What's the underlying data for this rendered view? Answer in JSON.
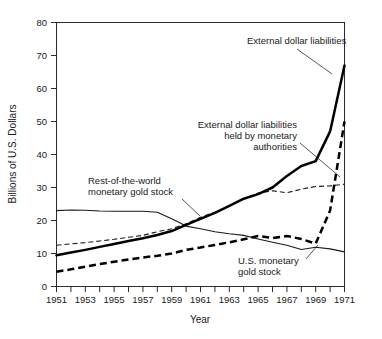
{
  "chart_data": {
    "type": "line",
    "title": "",
    "xlabel": "Year",
    "ylabel": "Billions of U.S. Dollars",
    "xlim": [
      1951,
      1971
    ],
    "ylim": [
      0,
      80
    ],
    "grid": false,
    "legend_position": "none (inline annotations with leader lines)",
    "x": [
      1951,
      1952,
      1953,
      1954,
      1955,
      1956,
      1957,
      1958,
      1959,
      1960,
      1961,
      1962,
      1963,
      1964,
      1965,
      1966,
      1967,
      1968,
      1969,
      1970,
      1971
    ],
    "xtick_labels": [
      "1951",
      "1953",
      "1955",
      "1957",
      "1959",
      "1961",
      "1963",
      "1965",
      "1967",
      "1969",
      "1971"
    ],
    "xtick_values": [
      1951,
      1953,
      1955,
      1957,
      1959,
      1961,
      1963,
      1965,
      1967,
      1969,
      1971
    ],
    "xtick_minor_every": 1,
    "ytick_labels": [
      "0",
      "10",
      "20",
      "30",
      "40",
      "50",
      "60",
      "70",
      "80"
    ],
    "ytick_values": [
      0,
      10,
      20,
      30,
      40,
      50,
      60,
      70,
      80
    ],
    "series": [
      {
        "name": "External dollar liabilities",
        "style": "thick-solid",
        "annotation": "External dollar liabilities",
        "values": [
          9.5,
          10.3,
          11.1,
          12.0,
          12.9,
          13.8,
          14.6,
          15.6,
          16.8,
          18.7,
          20.5,
          22.3,
          24.4,
          26.6,
          28.0,
          30.0,
          33.5,
          36.5,
          38.0,
          47.0,
          67.0
        ]
      },
      {
        "name": "External dollar liabilities held by monetary authorities",
        "style": "thick-dashed",
        "annotation": "External dollar liabilities\nheld by monetary\nauthorities",
        "values": [
          4.5,
          5.2,
          6.0,
          6.8,
          7.5,
          8.2,
          8.8,
          9.3,
          10.0,
          11.1,
          11.8,
          12.6,
          13.4,
          14.3,
          15.3,
          14.7,
          15.3,
          14.4,
          13.0,
          23.0,
          50.0
        ]
      },
      {
        "name": "Rest-of-the-world monetary gold stock",
        "style": "thin-dashed",
        "annotation": "Rest-of-the-world\nmonetary gold stock",
        "values": [
          12.5,
          12.9,
          13.3,
          13.8,
          14.3,
          14.9,
          15.5,
          16.6,
          17.5,
          19.0,
          21.0,
          22.5,
          24.3,
          26.5,
          28.3,
          29.0,
          28.4,
          29.5,
          30.3,
          30.5,
          31.0
        ]
      },
      {
        "name": "U.S. monetary gold stock",
        "style": "thin-solid",
        "annotation": "U.S. monetary\ngold stock",
        "values": [
          23.0,
          23.2,
          23.1,
          22.9,
          22.8,
          22.8,
          22.8,
          22.5,
          20.5,
          18.3,
          17.5,
          16.6,
          16.0,
          15.5,
          14.4,
          13.4,
          12.5,
          11.2,
          11.9,
          11.4,
          10.5
        ]
      }
    ],
    "annotations": [
      {
        "name": "external-dollar-liabilities",
        "text": "External dollar liabilities"
      },
      {
        "name": "held-by-monetary-authorities",
        "text_lines": [
          "External dollar liabilities",
          "held by monetary",
          "authorities"
        ]
      },
      {
        "name": "rest-of-world-gold",
        "text_lines": [
          "Rest-of-the-world",
          "monetary gold stock"
        ]
      },
      {
        "name": "us-monetary-gold",
        "text_lines": [
          "U.S. monetary",
          "gold stock"
        ]
      }
    ]
  },
  "labels": {
    "y_axis_title": "Billions of U.S. Dollars",
    "x_axis_title": "Year",
    "annot_external": "External dollar liabilities",
    "annot_held_1": "External dollar liabilities",
    "annot_held_2": "held by monetary",
    "annot_held_3": "authorities",
    "annot_row_1": "Rest-of-the-world",
    "annot_row_2": "monetary gold stock",
    "annot_us_1": "U.S. monetary",
    "annot_us_2": "gold stock",
    "y_0": "0",
    "y_10": "10",
    "y_20": "20",
    "y_30": "30",
    "y_40": "40",
    "y_50": "50",
    "y_60": "60",
    "y_70": "70",
    "y_80": "80",
    "x_1951": "1951",
    "x_1953": "1953",
    "x_1955": "1955",
    "x_1957": "1957",
    "x_1959": "1959",
    "x_1961": "1961",
    "x_1963": "1963",
    "x_1965": "1965",
    "x_1967": "1967",
    "x_1969": "1969",
    "x_1971": "1971"
  },
  "colors": {
    "line": "#000000",
    "axis": "#2b2b2b",
    "text": "#1a1a1a",
    "background": "#ffffff"
  }
}
